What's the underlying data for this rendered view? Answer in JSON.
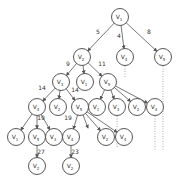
{
  "diagram": {
    "type": "search-tree",
    "colors": {
      "node_stroke": "#444444",
      "edge": "#555555",
      "dotted": "#999999",
      "text": "#333333",
      "background": "#ffffff"
    },
    "nodes": [
      {
        "id": "n0",
        "label": "V",
        "sub": "1",
        "x": 120,
        "y": 17
      },
      {
        "id": "n1",
        "label": "V",
        "sub": "2",
        "x": 82,
        "y": 57
      },
      {
        "id": "n2",
        "label": "V",
        "sub": "4",
        "x": 125,
        "y": 57
      },
      {
        "id": "n3",
        "label": "V",
        "sub": "5",
        "x": 163,
        "y": 57
      },
      {
        "id": "n4",
        "label": "V",
        "sub": "3",
        "x": 61,
        "y": 82
      },
      {
        "id": "n5",
        "label": "V",
        "sub": "1",
        "x": 85,
        "y": 82
      },
      {
        "id": "n6",
        "label": "V",
        "sub": "5",
        "x": 108,
        "y": 82
      },
      {
        "id": "n7",
        "label": "V",
        "sub": "4",
        "x": 37,
        "y": 107
      },
      {
        "id": "n8",
        "label": "V",
        "sub": "2",
        "x": 58,
        "y": 107
      },
      {
        "id": "n9",
        "label": "V",
        "sub": "5",
        "x": 80,
        "y": 107
      },
      {
        "id": "n10",
        "label": "V",
        "sub": "1",
        "x": 97,
        "y": 107
      },
      {
        "id": "n11",
        "label": "V",
        "sub": "3",
        "x": 117,
        "y": 107
      },
      {
        "id": "n12",
        "label": "V",
        "sub": "2",
        "x": 137,
        "y": 107
      },
      {
        "id": "n13",
        "label": "V",
        "sub": "4",
        "x": 155,
        "y": 107
      },
      {
        "id": "n14",
        "label": "V",
        "sub": "1",
        "x": 16,
        "y": 137
      },
      {
        "id": "n15",
        "label": "V",
        "sub": "5",
        "x": 37,
        "y": 137
      },
      {
        "id": "n16",
        "label": "V",
        "sub": "3",
        "x": 54,
        "y": 137
      },
      {
        "id": "n17",
        "label": "V",
        "sub": "4",
        "x": 71,
        "y": 137
      },
      {
        "id": "n18",
        "label": "V",
        "sub": "2",
        "x": 106,
        "y": 137
      },
      {
        "id": "n19",
        "label": "V",
        "sub": "4",
        "x": 124,
        "y": 137
      },
      {
        "id": "n20",
        "label": "V",
        "sub": "2",
        "x": 37,
        "y": 166
      },
      {
        "id": "n21",
        "label": "V",
        "sub": "2",
        "x": 71,
        "y": 166
      }
    ],
    "edges": [
      {
        "from": "n0",
        "to": "n1",
        "weight": "5",
        "lx": 98,
        "ly": 34
      },
      {
        "from": "n0",
        "to": "n2",
        "weight": "4",
        "lx": 119,
        "ly": 38
      },
      {
        "from": "n0",
        "to": "n3",
        "weight": "8",
        "lx": 149,
        "ly": 34
      },
      {
        "from": "n1",
        "to": "n4",
        "weight": "9",
        "lx": 68,
        "ly": 66
      },
      {
        "from": "n1",
        "to": "n5",
        "weight": "",
        "lx": 0,
        "ly": 0
      },
      {
        "from": "n1",
        "to": "n6",
        "weight": "11",
        "lx": 102,
        "ly": 66
      },
      {
        "from": "n4",
        "to": "n7",
        "weight": "14",
        "lx": 42,
        "ly": 90
      },
      {
        "from": "n4",
        "to": "n8",
        "weight": "",
        "lx": 0,
        "ly": 0
      },
      {
        "from": "n4",
        "to": "n9",
        "weight": "14",
        "lx": 75,
        "ly": 92
      },
      {
        "from": "n6",
        "to": "n10",
        "weight": "",
        "lx": 0,
        "ly": 0
      },
      {
        "from": "n6",
        "to": "n11",
        "weight": "",
        "lx": 0,
        "ly": 0
      },
      {
        "from": "n6",
        "to": "n12",
        "weight": "",
        "lx": 0,
        "ly": 0
      },
      {
        "from": "n6",
        "to": "n13",
        "weight": "",
        "lx": 0,
        "ly": 0
      },
      {
        "from": "n7",
        "to": "n14",
        "weight": "",
        "lx": 0,
        "ly": 0
      },
      {
        "from": "n7",
        "to": "n15",
        "weight": "19",
        "lx": 41,
        "ly": 120
      },
      {
        "from": "n7",
        "to": "n16",
        "weight": "",
        "lx": 0,
        "ly": 0
      },
      {
        "from": "n9",
        "to": "n17",
        "weight": "19",
        "lx": 68,
        "ly": 120
      },
      {
        "from": "n9",
        "to": "n18",
        "weight": "",
        "lx": 0,
        "ly": 0
      },
      {
        "from": "n9",
        "to": "n19",
        "weight": "",
        "lx": 0,
        "ly": 0
      },
      {
        "from": "n15",
        "to": "n20",
        "weight": "27",
        "lx": 41,
        "ly": 154
      },
      {
        "from": "n17",
        "to": "n21",
        "weight": "23",
        "lx": 75,
        "ly": 154
      }
    ],
    "stub_arrows": [
      {
        "from": "n9",
        "x2": 88,
        "y2": 128
      }
    ],
    "dotted_lines": [
      {
        "x": 125,
        "y1": 66,
        "y2": 78
      },
      {
        "x": 163,
        "y1": 66,
        "y2": 150
      },
      {
        "x": 117,
        "y1": 116,
        "y2": 148
      },
      {
        "x": 155,
        "y1": 116,
        "y2": 150
      }
    ],
    "node_radius": 8.5
  }
}
